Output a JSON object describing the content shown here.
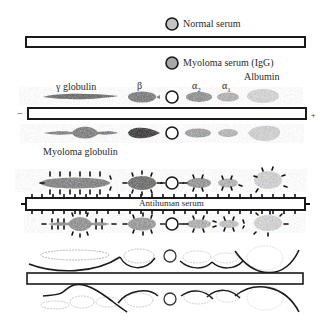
{
  "legend": {
    "normal_serum": "Normal serum",
    "myeloma_serum": "Myoloma serum (IgG)"
  },
  "electrophoresis": {
    "fraction_labels": {
      "gamma": "γ globulin",
      "beta": "β",
      "alpha2": "α",
      "alpha2_sub": "2",
      "alpha1": "α",
      "alpha1_sub": "1",
      "albumin": "Albumin"
    },
    "cathode": "−",
    "anode": "+",
    "myeloma_label": "Myoloma globulin"
  },
  "immunodiffusion": {
    "antiserum_label": "Antihuman serum"
  },
  "colors": {
    "outline": "#1a1a1a",
    "blob_dark": "#6e6e6e",
    "blob_mid": "#9a9a9a",
    "blob_light": "#c8c8c8",
    "blob_faint": "#e2e2e2",
    "well_fill_gray": "#b5b5b5"
  }
}
